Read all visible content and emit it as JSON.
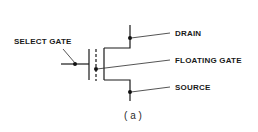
{
  "diagram": {
    "labels": {
      "select_gate": "SELECT GATE",
      "drain": "DRAIN",
      "floating_gate": "FLOATING GATE",
      "source": "SOURCE"
    },
    "caption": "( a )",
    "colors": {
      "line": "#1a1a1a",
      "background": "#ffffff"
    }
  }
}
